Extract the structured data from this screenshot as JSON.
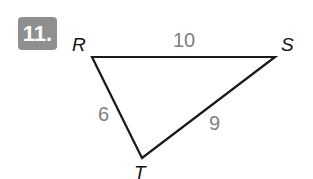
{
  "problem": {
    "number": "11."
  },
  "triangle": {
    "vertices": [
      {
        "name": "R",
        "x": 92,
        "y": 57
      },
      {
        "name": "S",
        "x": 275,
        "y": 57
      },
      {
        "name": "T",
        "x": 142,
        "y": 158
      }
    ],
    "sides": [
      {
        "between": "RS",
        "length": "10"
      },
      {
        "between": "RT",
        "length": "6"
      },
      {
        "between": "ST",
        "length": "9"
      }
    ]
  },
  "colors": {
    "badge": "#8f8f8f",
    "side_label": "#808080",
    "line": "#1a1a1a"
  }
}
